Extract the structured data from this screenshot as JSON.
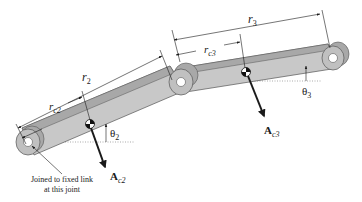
{
  "figure": {
    "type": "two-link linkage with centers of gravity and acceleration vectors",
    "colors": {
      "link_fill": "#c8c8c8",
      "link_top": "#a8a8a8",
      "link_edge": "#555555",
      "joint_fill": "#b4b4b4",
      "joint_hole": "#ffffff",
      "line": "#1a1a1a",
      "reference_dotted": "#888888"
    }
  },
  "labels": {
    "r2": {
      "main": "r",
      "sub": "2"
    },
    "rc2": {
      "main": "r",
      "sub": "c2"
    },
    "r3": {
      "main": "r",
      "sub": "3"
    },
    "rc3": {
      "main": "r",
      "sub": "c3"
    },
    "theta2": {
      "main": "θ",
      "sub": "2"
    },
    "theta3": {
      "main": "θ",
      "sub": "3"
    },
    "ac2": {
      "main": "A",
      "sub": "c2"
    },
    "ac3": {
      "main": "A",
      "sub": "c3"
    }
  },
  "annotation": {
    "line1": "Joined to fixed link",
    "line2": "at this joint"
  }
}
